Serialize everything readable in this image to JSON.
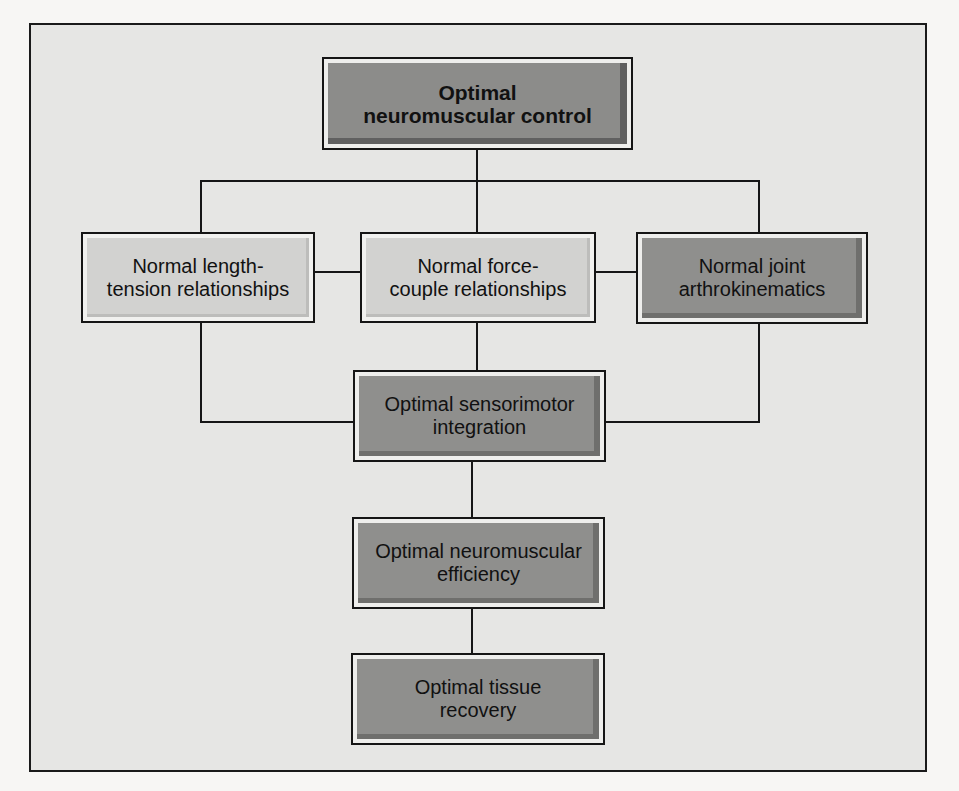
{
  "diagram": {
    "type": "hierarchy-flowchart",
    "nodes": {
      "top": "Optimal\nneuromuscular control",
      "left": "Normal length-\ntension relationships",
      "middle": "Normal force-\ncouple relationships",
      "right": "Normal joint\narthrokinematics",
      "sensorimotor": "Optimal sensorimotor\nintegration",
      "efficiency": "Optimal neuromuscular\nefficiency",
      "recovery": "Optimal tissue\nrecovery"
    },
    "edges": [
      [
        "top",
        "left"
      ],
      [
        "top",
        "middle"
      ],
      [
        "top",
        "right"
      ],
      [
        "left",
        "middle"
      ],
      [
        "middle",
        "right"
      ],
      [
        "left",
        "sensorimotor"
      ],
      [
        "middle",
        "sensorimotor"
      ],
      [
        "right",
        "sensorimotor"
      ],
      [
        "sensorimotor",
        "efficiency"
      ],
      [
        "efficiency",
        "recovery"
      ]
    ],
    "colors": {
      "frame_background": "#e6e6e4",
      "light_box": "#d2d2d0",
      "dark_box": "#8f8f8d",
      "line": "#161616"
    }
  }
}
